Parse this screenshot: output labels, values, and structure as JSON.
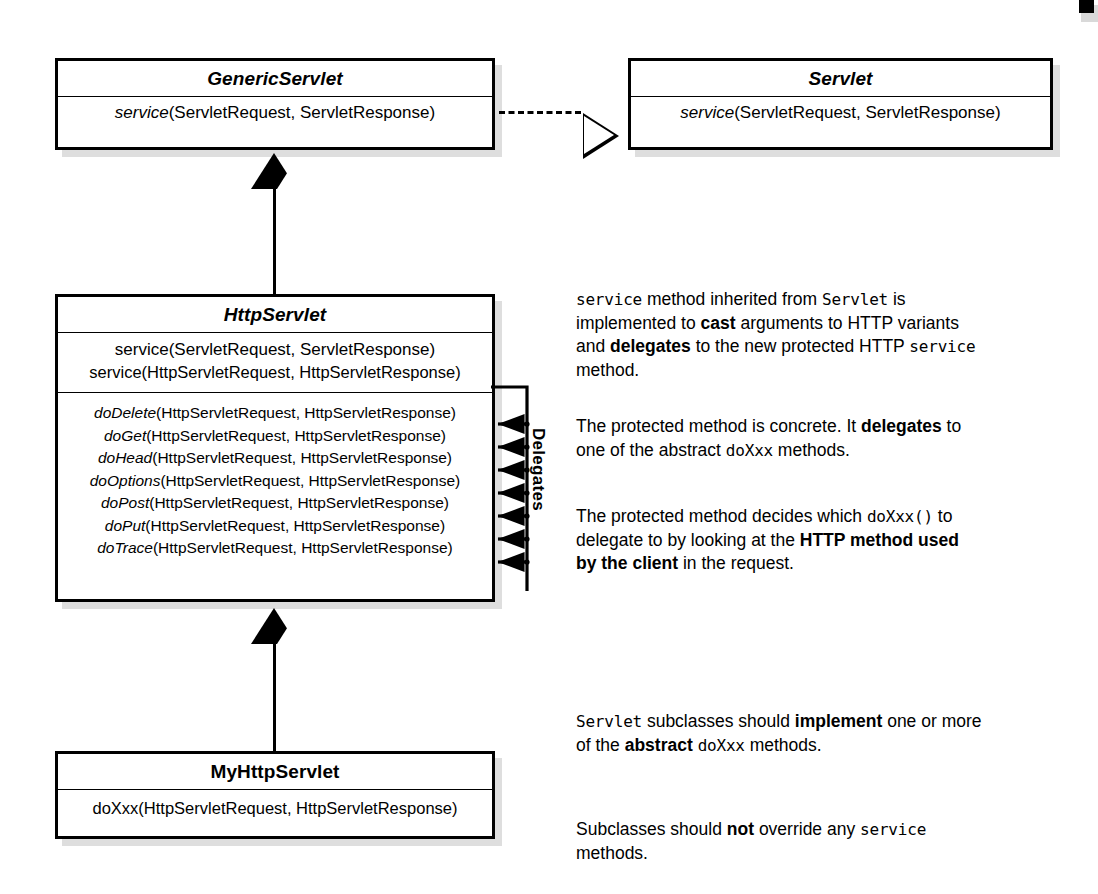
{
  "diagram": {
    "type": "uml-class-diagram",
    "title_visible": false,
    "classes": [
      {
        "id": "generic-servlet",
        "name": "GenericServlet",
        "stereotype": "abstract-class",
        "name_style": "bold-italic",
        "sections": [
          {
            "methods": [
              {
                "name": "service",
                "name_style": "italic",
                "params": "(ServletRequest, ServletResponse)"
              }
            ]
          }
        ]
      },
      {
        "id": "servlet",
        "name": "Servlet",
        "stereotype": "interface",
        "name_style": "bold-italic",
        "sections": [
          {
            "methods": [
              {
                "name": "service",
                "name_style": "italic",
                "params": "(ServletRequest, ServletResponse)"
              }
            ]
          }
        ]
      },
      {
        "id": "http-servlet",
        "name": "HttpServlet",
        "stereotype": "abstract-class",
        "name_style": "bold-italic",
        "sections": [
          {
            "methods": [
              {
                "name": "service",
                "name_style": "normal",
                "params": "(ServletRequest, ServletResponse)"
              },
              {
                "name": "service",
                "name_style": "normal",
                "params": "(HttpServletRequest, HttpServletResponse)"
              }
            ]
          },
          {
            "methods": [
              {
                "name": "doDelete",
                "name_style": "italic",
                "params": "(HttpServletRequest, HttpServletResponse)"
              },
              {
                "name": "doGet",
                "name_style": "italic",
                "params": "(HttpServletRequest, HttpServletResponse)"
              },
              {
                "name": "doHead",
                "name_style": "italic",
                "params": "(HttpServletRequest, HttpServletResponse)"
              },
              {
                "name": "doOptions",
                "name_style": "italic",
                "params": "(HttpServletRequest, HttpServletResponse)"
              },
              {
                "name": "doPost",
                "name_style": "italic",
                "params": "(HttpServletRequest, HttpServletResponse)"
              },
              {
                "name": "doPut",
                "name_style": "italic",
                "params": "(HttpServletRequest, HttpServletResponse)"
              },
              {
                "name": "doTrace",
                "name_style": "italic",
                "params": "(HttpServletRequest, HttpServletResponse)"
              }
            ]
          }
        ]
      },
      {
        "id": "my-http-servlet",
        "name": "MyHttpServlet",
        "stereotype": "concrete-class",
        "name_style": "bold",
        "sections": [
          {
            "methods": [
              {
                "name": "doXxx",
                "name_style": "normal",
                "params": "(HttpServletRequest, HttpServletResponse)"
              }
            ]
          }
        ]
      }
    ],
    "relationships": [
      {
        "kind": "realization",
        "label": "",
        "from": "generic-servlet",
        "to": "servlet",
        "line": "dashed",
        "arrow": "hollow-triangle"
      },
      {
        "kind": "generalization",
        "label": "",
        "from": "http-servlet",
        "to": "generic-servlet",
        "line": "solid",
        "arrow": "hollow-triangle"
      },
      {
        "kind": "generalization",
        "label": "",
        "from": "my-http-servlet",
        "to": "http-servlet",
        "line": "solid",
        "arrow": "hollow-triangle"
      },
      {
        "kind": "delegation",
        "label": "Delegates",
        "from": "service(HttpServletRequest, HttpServletResponse)",
        "to": "doXxx methods",
        "line": "solid",
        "arrow": "filled-arrow",
        "fan_out_count": 7
      }
    ],
    "delegates_label": "Delegates"
  },
  "notes": [
    {
      "id": "note-service-cast",
      "runs": [
        {
          "text": "service",
          "style": "mono"
        },
        {
          "text": " method inherited from ",
          "style": "normal"
        },
        {
          "text": "Servlet",
          "style": "mono"
        },
        {
          "text": " is implemented to ",
          "style": "normal"
        },
        {
          "text": "cast",
          "style": "bold"
        },
        {
          "text": " arguments to HTTP variants and ",
          "style": "normal"
        },
        {
          "text": "delegates",
          "style": "bold"
        },
        {
          "text": " to the new protected HTTP ",
          "style": "normal"
        },
        {
          "text": "service",
          "style": "mono"
        },
        {
          "text": " method.",
          "style": "normal"
        }
      ]
    },
    {
      "id": "note-protected-concrete",
      "runs": [
        {
          "text": "The protected method is concrete. It ",
          "style": "normal"
        },
        {
          "text": "delegates",
          "style": "bold"
        },
        {
          "text": " to one of the abstract ",
          "style": "normal"
        },
        {
          "text": "doXxx",
          "style": "mono"
        },
        {
          "text": " methods.",
          "style": "normal"
        }
      ]
    },
    {
      "id": "note-protected-decides",
      "runs": [
        {
          "text": "The protected method decides which ",
          "style": "normal"
        },
        {
          "text": "doXxx()",
          "style": "mono"
        },
        {
          "text": " to delegate to by looking at the ",
          "style": "normal"
        },
        {
          "text": "HTTP method used by the client",
          "style": "bold"
        },
        {
          "text": " in the request.",
          "style": "normal"
        }
      ]
    },
    {
      "id": "note-subclasses-implement",
      "runs": [
        {
          "text": "Servlet",
          "style": "mono"
        },
        {
          "text": " subclasses should ",
          "style": "normal"
        },
        {
          "text": "implement",
          "style": "bold"
        },
        {
          "text": " one or more of the ",
          "style": "normal"
        },
        {
          "text": "abstract",
          "style": "bold"
        },
        {
          "text": " ",
          "style": "normal"
        },
        {
          "text": "doXxx",
          "style": "mono"
        },
        {
          "text": " methods.",
          "style": "normal"
        }
      ]
    },
    {
      "id": "note-subclasses-not-override",
      "runs": [
        {
          "text": "Subclasses should ",
          "style": "normal"
        },
        {
          "text": "not",
          "style": "bold"
        },
        {
          "text": " override any ",
          "style": "normal"
        },
        {
          "text": "service",
          "style": "mono"
        },
        {
          "text": " methods.",
          "style": "normal"
        }
      ]
    }
  ],
  "colors": {
    "ink": "#000000",
    "page": "#ffffff",
    "shadow": "#dedede"
  }
}
